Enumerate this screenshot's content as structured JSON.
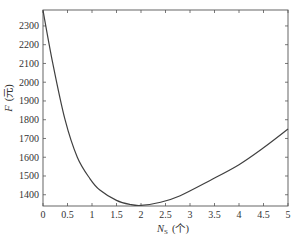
{
  "chart_data": {
    "type": "line",
    "title": "",
    "xlabel": "N_S (个)",
    "xlabel_main": "N",
    "xlabel_sub": "S",
    "xlabel_unit": "(个)",
    "ylabel": "F (元)",
    "ylabel_main": "F",
    "ylabel_unit": "(元)",
    "xlim": [
      0,
      5
    ],
    "ylim": [
      1340,
      2385
    ],
    "xticks": [
      0,
      0.5,
      1,
      1.5,
      2,
      2.5,
      3,
      3.5,
      4,
      4.5,
      5
    ],
    "xtick_labels": [
      "0",
      "0.5",
      "1",
      "1.5",
      "2",
      "2.5",
      "3",
      "3.5",
      "4",
      "4.5",
      "5"
    ],
    "yticks": [
      1400,
      1500,
      1600,
      1700,
      1800,
      1900,
      2000,
      2100,
      2200,
      2300
    ],
    "ytick_labels": [
      "1400",
      "1500",
      "1600",
      "1700",
      "1800",
      "1900",
      "2000",
      "2100",
      "2200",
      "2300"
    ],
    "grid": false,
    "legend": null,
    "series": [
      {
        "name": "F",
        "color": "#404040",
        "x": [
          0,
          0.2,
          0.45,
          0.7,
          0.96,
          1.16,
          1.5,
          1.78,
          2.0,
          2.4,
          2.8,
          3.4,
          4.0,
          4.5,
          5.0
        ],
        "y": [
          2383,
          2100,
          1800,
          1600,
          1485,
          1425,
          1370,
          1348,
          1343,
          1360,
          1395,
          1475,
          1560,
          1650,
          1750
        ]
      }
    ]
  }
}
